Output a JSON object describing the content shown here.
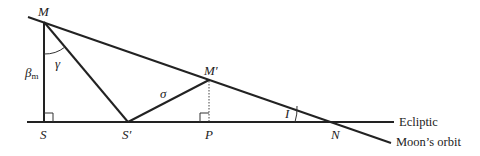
{
  "diagram": {
    "points": {
      "M": {
        "label": "M",
        "x": 44,
        "y": 22
      },
      "S": {
        "label": "S",
        "x": 44,
        "y": 122
      },
      "S_prime": {
        "label": "S′",
        "x": 128,
        "y": 122
      },
      "M_prime": {
        "label": "M′",
        "x": 209,
        "y": 80
      },
      "P": {
        "label": "P",
        "x": 209,
        "y": 122
      },
      "N": {
        "label": "N",
        "x": 339,
        "y": 122
      }
    },
    "angle_labels": {
      "gamma": "γ",
      "sigma": "σ",
      "inclination": "I"
    },
    "segment_labels": {
      "beta_m": "β",
      "beta_m_sub": "m"
    },
    "line_labels": {
      "ecliptic": "Ecliptic",
      "moons_orbit": "Moon’s orbit"
    },
    "colors": {
      "stroke": "#222222",
      "background": "#ffffff"
    }
  }
}
